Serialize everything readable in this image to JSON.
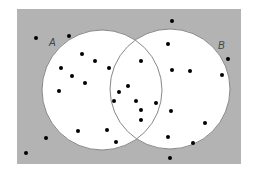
{
  "diagram": {
    "type": "venn",
    "universe": {
      "x": 17,
      "y": 9,
      "w": 224,
      "h": 155,
      "fill": "#b3b3b3"
    },
    "sets": [
      {
        "label": "A",
        "cx": 102,
        "cy": 90,
        "r": 60,
        "label_x": 49,
        "label_y": 46
      },
      {
        "label": "B",
        "cx": 170,
        "cy": 89,
        "r": 60,
        "label_x": 218,
        "label_y": 49
      }
    ],
    "circle_fill": "#ffffff",
    "circle_stroke": "#888888",
    "points": [
      [
        36,
        38
      ],
      [
        69,
        36
      ],
      [
        172,
        21
      ],
      [
        228,
        59
      ],
      [
        82,
        54
      ],
      [
        95,
        61
      ],
      [
        61,
        68
      ],
      [
        109,
        68
      ],
      [
        85,
        83
      ],
      [
        72,
        76
      ],
      [
        59,
        91
      ],
      [
        114,
        101
      ],
      [
        78,
        131
      ],
      [
        107,
        130
      ],
      [
        119,
        92
      ],
      [
        141,
        61
      ],
      [
        136,
        101
      ],
      [
        141,
        110
      ],
      [
        128,
        86
      ],
      [
        156,
        103
      ],
      [
        141,
        120
      ],
      [
        168,
        44
      ],
      [
        172,
        70
      ],
      [
        190,
        71
      ],
      [
        222,
        75
      ],
      [
        171,
        111
      ],
      [
        205,
        123
      ],
      [
        168,
        137
      ],
      [
        193,
        143
      ],
      [
        46,
        138
      ],
      [
        26,
        153
      ],
      [
        116,
        142
      ],
      [
        170,
        158
      ]
    ],
    "point_color": "#000000"
  }
}
